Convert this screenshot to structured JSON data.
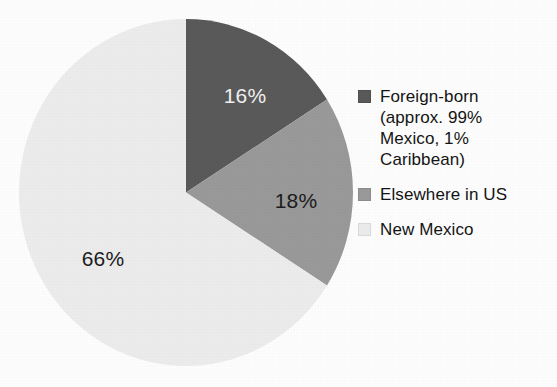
{
  "chart_data": {
    "type": "pie",
    "title": "",
    "subtitle": "",
    "xlabel": "",
    "ylabel": "",
    "grid": false,
    "legend_position": "right",
    "start_angle_deg": 0,
    "direction": "clockwise",
    "categories": [
      "Foreign-born (approx. 99% Mexico, 1% Caribbean)",
      "Elsewhere in US",
      "New Mexico"
    ],
    "values": [
      16,
      18,
      66
    ],
    "value_labels": [
      "16%",
      "18%",
      "66%"
    ],
    "colors": [
      "#5a5a5a",
      "#9a9a9a",
      "#ededed"
    ],
    "label_text_colors": [
      "#f2f2f2",
      "#1c1c1c",
      "#1c1c1c"
    ],
    "units": "percent",
    "total": 100
  },
  "slices": [
    {
      "name": "foreign-born",
      "value_label": "16%",
      "value": 16,
      "color": "#5a5a5a",
      "text_color": "#f2f2f2"
    },
    {
      "name": "elsewhere",
      "value_label": "18%",
      "value": 18,
      "color": "#9a9a9a",
      "text_color": "#1c1c1c"
    },
    {
      "name": "new-mexico",
      "value_label": "66%",
      "value": 66,
      "color": "#ededed",
      "text_color": "#1c1c1c"
    }
  ],
  "legend": {
    "items": [
      {
        "label": "Foreign-born\n(approx. 99%\nMexico, 1%\nCaribbean)",
        "swatch_color": "#5a5a5a"
      },
      {
        "label": "Elsewhere in US",
        "swatch_color": "#9a9a9a"
      },
      {
        "label": "New Mexico",
        "swatch_color": "#ededed"
      }
    ]
  },
  "colors": {
    "background": "#fefefe",
    "slice_dark": "#5a5a5a",
    "slice_medium": "#9a9a9a",
    "slice_light": "#ededed",
    "text": "#141414"
  }
}
